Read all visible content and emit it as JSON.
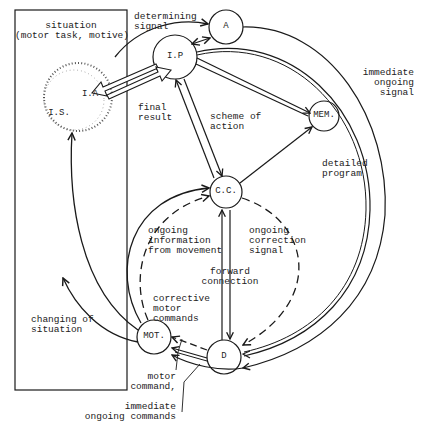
{
  "diagram": {
    "situation_box": {
      "title": "situation",
      "subtitle": "(motor task, motive)"
    },
    "nodes": {
      "A": "A",
      "IP": "I.P",
      "IA": "I.A",
      "IS": "I.S.",
      "MEM": "MEM.",
      "CC": "C.C.",
      "MOT": "MOT.",
      "D": "D"
    },
    "labels": {
      "determining_signal": "determining\nsignal",
      "immediate_ongoing_signal": "immediate\nongoing\nsignal",
      "final_result": "final\nresult",
      "scheme_of_action": "scheme of\naction",
      "detailed_program": "detailed\nprogram",
      "ongoing_information": "ongoing\ninformation\nfrom movement",
      "ongoing_correction_signal": "ongoing\ncorrection\nsignal",
      "forward_connection": "forward\nconnection",
      "corrective_motor_commands": "corrective\nmotor\ncommands",
      "changing_of_situation": "changing of\nsituation",
      "motor_command": "motor\ncommand,",
      "immediate_ongoing_commands": "immediate\nongoing commands"
    }
  }
}
